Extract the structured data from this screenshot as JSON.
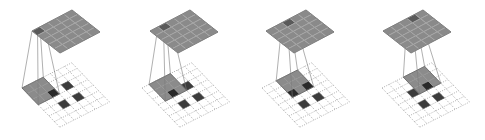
{
  "diagram": {
    "title": "",
    "input_grid_size": 7,
    "output_grid_size": 5,
    "kernel_size": 3,
    "input_cells": [
      [
        2,
        2
      ],
      [
        2,
        4
      ],
      [
        4,
        2
      ],
      [
        4,
        4
      ]
    ],
    "colors": {
      "background": "#ffffff",
      "output_fill": "#8a8a8a",
      "output_highlight": "#5a5a5a",
      "output_line": "#a8a8a8",
      "output_edge": "#6a6a6a",
      "kernel_fill": "#7e7e7e",
      "kernel_line": "#9a9a9a",
      "input_fill": "#3c3c3c",
      "input_under_kernel": "#2a2a2a",
      "dashed_grid": "#8c8c8c",
      "projection_line": "#7a7a7a"
    },
    "panels": [
      {
        "name": "step-1",
        "kernel_pos": [
          0,
          0
        ],
        "output_highlight": [
          0,
          0
        ],
        "bottom_origin": [
          22,
          88
        ],
        "top_origin": [
          32,
          31
        ]
      },
      {
        "name": "step-2",
        "kernel_pos": [
          1,
          0
        ],
        "output_highlight": [
          1,
          0
        ],
        "bottom_origin": [
          142,
          88
        ],
        "top_origin": [
          150,
          31
        ]
      },
      {
        "name": "step-3",
        "kernel_pos": [
          2,
          0
        ],
        "output_highlight": [
          2,
          0
        ],
        "bottom_origin": [
          262,
          88
        ],
        "top_origin": [
          266,
          31
        ]
      },
      {
        "name": "step-4",
        "kernel_pos": [
          3,
          0
        ],
        "output_highlight": [
          3,
          0
        ],
        "bottom_origin": [
          382,
          88
        ],
        "top_origin": [
          383,
          31
        ]
      }
    ],
    "projection": {
      "bottom_axis_a": [
        7.1,
        -3.6
      ],
      "bottom_axis_b": [
        5.4,
        5.6
      ],
      "top_axis_a": [
        8.0,
        -4.2
      ],
      "top_axis_b": [
        5.6,
        4.4
      ]
    }
  }
}
